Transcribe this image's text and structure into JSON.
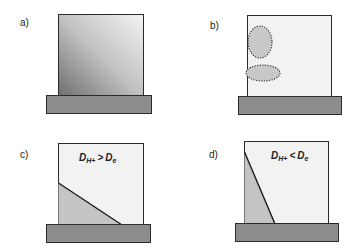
{
  "figure": {
    "panels": [
      {
        "id": "a",
        "label": "a)",
        "description": "gradient-filled block on substrate"
      },
      {
        "id": "b",
        "label": "b)",
        "description": "block with two dotted-outline elliptical regions"
      },
      {
        "id": "c",
        "label": "c)",
        "equation": {
          "lhs": "D",
          "lhs_sub": "H+",
          "op": ">",
          "rhs": "D",
          "rhs_sub": "e"
        }
      },
      {
        "id": "d",
        "label": "d)",
        "equation": {
          "lhs": "D",
          "lhs_sub": "H+",
          "op": "<",
          "rhs": "D",
          "rhs_sub": "e"
        }
      }
    ],
    "colors": {
      "box_fill": "#f2f2f2",
      "box_stroke": "#2a2a2a",
      "base_fill": "#8c8c8c",
      "shaded_region": "#c4c4c4",
      "ellipse_fill": "#c8c8c8",
      "gradient_dark": "#7a7a7a",
      "gradient_light": "#f0f0f0"
    }
  }
}
